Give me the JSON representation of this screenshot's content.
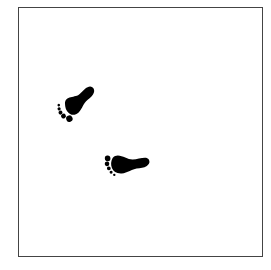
{
  "figure": {
    "description": "Two black footprints inside a square frame",
    "frame_color": "#444444",
    "ink_color": "#000000",
    "footprints": [
      {
        "id": "upper-left",
        "x": 52,
        "y": 80,
        "rotation": -28
      },
      {
        "id": "center",
        "x": 98,
        "y": 145,
        "rotation": -5
      }
    ]
  }
}
